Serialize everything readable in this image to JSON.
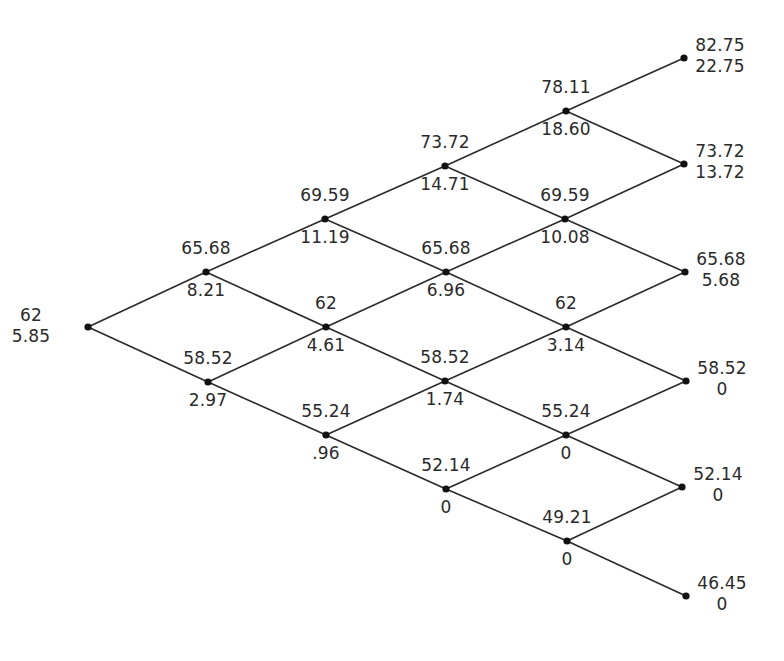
{
  "diagram": {
    "type": "binomial-tree",
    "steps": 5,
    "nodes": [
      {
        "id": "n0_0",
        "step": 0,
        "x": 88,
        "y": 327,
        "price": "62",
        "value": "5.85"
      },
      {
        "id": "n1_0",
        "step": 1,
        "x": 206,
        "y": 272,
        "price": "65.68",
        "value": "8.21"
      },
      {
        "id": "n1_1",
        "step": 1,
        "x": 208,
        "y": 382,
        "price": "58.52",
        "value": "2.97"
      },
      {
        "id": "n2_0",
        "step": 2,
        "x": 325,
        "y": 219,
        "price": "69.59",
        "value": "11.19"
      },
      {
        "id": "n2_1",
        "step": 2,
        "x": 326,
        "y": 327,
        "price": "62",
        "value": "4.61"
      },
      {
        "id": "n2_2",
        "step": 2,
        "x": 326,
        "y": 435,
        "price": "55.24",
        "value": ".96"
      },
      {
        "id": "n3_0",
        "step": 3,
        "x": 445,
        "y": 166,
        "price": "73.72",
        "value": "14.71"
      },
      {
        "id": "n3_1",
        "step": 3,
        "x": 446,
        "y": 272,
        "price": "65.68",
        "value": "6.96"
      },
      {
        "id": "n3_2",
        "step": 3,
        "x": 445,
        "y": 381,
        "price": "58.52",
        "value": "1.74"
      },
      {
        "id": "n3_3",
        "step": 3,
        "x": 446,
        "y": 489,
        "price": "52.14",
        "value": "0"
      },
      {
        "id": "n4_0",
        "step": 4,
        "x": 566,
        "y": 111,
        "price": "78.11",
        "value": "18.60"
      },
      {
        "id": "n4_1",
        "step": 4,
        "x": 565,
        "y": 219,
        "price": "69.59",
        "value": "10.08"
      },
      {
        "id": "n4_2",
        "step": 4,
        "x": 566,
        "y": 327,
        "price": "62",
        "value": "3.14"
      },
      {
        "id": "n4_3",
        "step": 4,
        "x": 566,
        "y": 435,
        "price": "55.24",
        "value": "0"
      },
      {
        "id": "n4_4",
        "step": 4,
        "x": 567,
        "y": 541,
        "price": "49.21",
        "value": "0"
      },
      {
        "id": "n5_0",
        "step": 5,
        "x": 684,
        "y": 58,
        "price": "82.75",
        "value": "22.75"
      },
      {
        "id": "n5_1",
        "step": 5,
        "x": 684,
        "y": 164,
        "price": "73.72",
        "value": "13.72"
      },
      {
        "id": "n5_2",
        "step": 5,
        "x": 685,
        "y": 272,
        "price": "65.68",
        "value": "5.68"
      },
      {
        "id": "n5_3",
        "step": 5,
        "x": 686,
        "y": 381,
        "price": "58.52",
        "value": "0"
      },
      {
        "id": "n5_4",
        "step": 5,
        "x": 682,
        "y": 487,
        "price": "52.14",
        "value": "0"
      },
      {
        "id": "n5_5",
        "step": 5,
        "x": 686,
        "y": 596,
        "price": "46.45",
        "value": "0"
      }
    ],
    "colors": {
      "line": "#2a2a2a",
      "node": "#111111",
      "text": "#2a2a2a",
      "background": "#ffffff"
    }
  }
}
